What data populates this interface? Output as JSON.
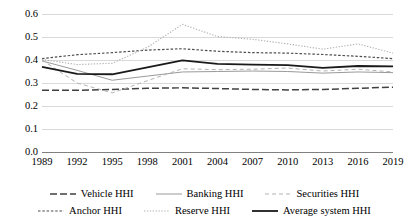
{
  "chart_data": {
    "type": "line",
    "title": "",
    "xlabel": "",
    "ylabel": "",
    "x": [
      1989,
      1992,
      1995,
      1998,
      2001,
      2004,
      2007,
      2010,
      2013,
      2016,
      2019
    ],
    "categories": [
      "1989",
      "1992",
      "1995",
      "1998",
      "2001",
      "2004",
      "2007",
      "2010",
      "2013",
      "2016",
      "2019"
    ],
    "ytick_labels": [
      "0.6",
      "0.5",
      "0.4",
      "0.3",
      "0.2",
      "0.1",
      "0.0"
    ],
    "ytick_values": [
      0.6,
      0.5,
      0.4,
      0.3,
      0.2,
      0.1,
      0.0
    ],
    "ylim": [
      0.0,
      0.6
    ],
    "xlim": [
      1989,
      2019
    ],
    "grid": true,
    "legend_position": "bottom",
    "series": [
      {
        "name": "Vehicle HHI",
        "style": "long-dash",
        "color": "#404040",
        "width": 1.5,
        "values": [
          0.268,
          0.268,
          0.272,
          0.277,
          0.279,
          0.276,
          0.272,
          0.27,
          0.272,
          0.277,
          0.282
        ]
      },
      {
        "name": "Banking HHI",
        "style": "solid-thin",
        "color": "#9a9a9a",
        "width": 1.0,
        "values": [
          0.396,
          0.355,
          0.312,
          0.33,
          0.348,
          0.35,
          0.352,
          0.35,
          0.343,
          0.348,
          0.345
        ]
      },
      {
        "name": "Securities HHI",
        "style": "dash",
        "color": "#b3b3b3",
        "width": 1.0,
        "values": [
          0.4,
          0.3,
          0.257,
          0.31,
          0.362,
          0.358,
          0.36,
          0.365,
          0.352,
          0.36,
          0.348
        ]
      },
      {
        "name": "Anchor HHI",
        "style": "fine-dash",
        "color": "#4d4d4d",
        "width": 1.2,
        "values": [
          0.406,
          0.423,
          0.432,
          0.443,
          0.449,
          0.438,
          0.432,
          0.43,
          0.424,
          0.416,
          0.406
        ]
      },
      {
        "name": "Reserve HHI",
        "style": "dotted",
        "color": "#b0b0b0",
        "width": 1.1,
        "values": [
          0.403,
          0.38,
          0.386,
          0.455,
          0.555,
          0.502,
          0.49,
          0.47,
          0.447,
          0.47,
          0.43
        ]
      },
      {
        "name": "Average system HHI",
        "style": "solid-thick",
        "color": "#1a1a1a",
        "width": 1.8,
        "values": [
          0.37,
          0.34,
          0.338,
          0.368,
          0.398,
          0.383,
          0.38,
          0.378,
          0.366,
          0.374,
          0.372
        ]
      }
    ]
  },
  "axes": {
    "ticks_y": [
      {
        "label": "0.6"
      },
      {
        "label": "0.5"
      },
      {
        "label": "0.4"
      },
      {
        "label": "0.3"
      },
      {
        "label": "0.2"
      },
      {
        "label": "0.1"
      },
      {
        "label": "0.0"
      }
    ],
    "ticks_x": [
      {
        "label": "1989"
      },
      {
        "label": "1992"
      },
      {
        "label": "1995"
      },
      {
        "label": "1998"
      },
      {
        "label": "2001"
      },
      {
        "label": "2004"
      },
      {
        "label": "2007"
      },
      {
        "label": "2010"
      },
      {
        "label": "2013"
      },
      {
        "label": "2016"
      },
      {
        "label": "2019"
      }
    ]
  },
  "legend": {
    "rows": [
      [
        {
          "label": "Vehicle HHI",
          "style": "long-dash",
          "color": "#404040"
        },
        {
          "label": "Banking HHI",
          "style": "solid-thin",
          "color": "#9a9a9a"
        },
        {
          "label": "Securities HHI",
          "style": "dash",
          "color": "#b3b3b3"
        }
      ],
      [
        {
          "label": "Anchor HHI",
          "style": "fine-dash",
          "color": "#4d4d4d"
        },
        {
          "label": "Reserve HHI",
          "style": "dotted",
          "color": "#b0b0b0"
        },
        {
          "label": "Average system HHI",
          "style": "solid-thick",
          "color": "#1a1a1a"
        }
      ]
    ]
  },
  "colors": {
    "background": "#ffffff",
    "gridline": "#d9d9d9",
    "axis": "#808080",
    "text": "#000000"
  }
}
